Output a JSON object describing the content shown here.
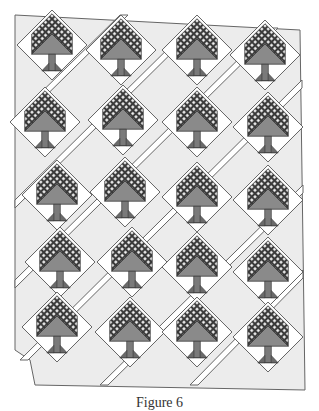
{
  "figure": {
    "caption": "Figure 6",
    "colors": {
      "background": "#ffffff",
      "setting_fabric": "#ececec",
      "sashing": "#ffffff",
      "outline": "#555555",
      "tree_dark": "#3a3a3a",
      "tree_mid": "#8a8a8a",
      "trunk": "#7a7a7a"
    }
  },
  "layout": {
    "rows": 5,
    "columns": 4,
    "block_count": 20,
    "trees": [
      {
        "row": 1,
        "col": 1,
        "x": 52,
        "y": 45
      },
      {
        "row": 1,
        "col": 2,
        "x": 121,
        "y": 50
      },
      {
        "row": 1,
        "col": 3,
        "x": 197,
        "y": 50
      },
      {
        "row": 1,
        "col": 4,
        "x": 265,
        "y": 55
      },
      {
        "row": 2,
        "col": 1,
        "x": 45,
        "y": 122
      },
      {
        "row": 2,
        "col": 2,
        "x": 123,
        "y": 120
      },
      {
        "row": 2,
        "col": 3,
        "x": 197,
        "y": 122
      },
      {
        "row": 2,
        "col": 4,
        "x": 268,
        "y": 127
      },
      {
        "row": 3,
        "col": 1,
        "x": 57,
        "y": 195
      },
      {
        "row": 3,
        "col": 2,
        "x": 125,
        "y": 192
      },
      {
        "row": 3,
        "col": 3,
        "x": 197,
        "y": 197
      },
      {
        "row": 3,
        "col": 4,
        "x": 268,
        "y": 200
      },
      {
        "row": 4,
        "col": 1,
        "x": 60,
        "y": 262
      },
      {
        "row": 4,
        "col": 2,
        "x": 132,
        "y": 262
      },
      {
        "row": 4,
        "col": 3,
        "x": 197,
        "y": 267
      },
      {
        "row": 4,
        "col": 4,
        "x": 268,
        "y": 272
      },
      {
        "row": 5,
        "col": 1,
        "x": 57,
        "y": 327
      },
      {
        "row": 5,
        "col": 2,
        "x": 130,
        "y": 332
      },
      {
        "row": 5,
        "col": 3,
        "x": 197,
        "y": 332
      },
      {
        "row": 5,
        "col": 4,
        "x": 268,
        "y": 337
      }
    ]
  }
}
